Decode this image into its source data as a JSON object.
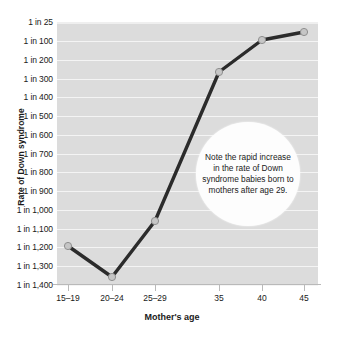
{
  "chart_data": {
    "type": "line",
    "title": "",
    "xlabel": "Mother's age",
    "ylabel": "Rate of Down syndrome",
    "categories": [
      "15–19",
      "20–24",
      "25–29",
      "35",
      "40",
      "45"
    ],
    "x_positions": [
      68,
      112,
      155,
      219,
      262,
      304
    ],
    "values": [
      1250,
      1400,
      1100,
      300,
      90,
      60
    ],
    "value_labels": [
      "1 in 1,250",
      "1 in 1,400",
      "1 in 1,100",
      "1 in 300",
      "1 in 90",
      "1 in 60"
    ],
    "y_tick_labels": [
      "1 in 25",
      "1 in 100",
      "1 in 200",
      "1 in 300",
      "1 in 400",
      "1 in 500",
      "1 in 600",
      "1 in 700",
      "1 in 800",
      "1 in 900",
      "1 in 1,000",
      "1 in 1,100",
      "1 in 1,200",
      "1 in 1,300",
      "1 in 1,400"
    ],
    "y_tick_values": [
      25,
      100,
      200,
      300,
      400,
      500,
      600,
      700,
      800,
      900,
      1000,
      1100,
      1200,
      1300,
      1400
    ],
    "y_tick_pixels": [
      22,
      41,
      60,
      79,
      97,
      116,
      135,
      154,
      172,
      191,
      210,
      229,
      247,
      266,
      285
    ],
    "grid": true,
    "legend": "none",
    "annotation": "Note the rapid increase in the rate of Down syndrome babies born to mothers after age 29.",
    "point_pixels": [
      {
        "x": 68,
        "y": 246
      },
      {
        "x": 112,
        "y": 277
      },
      {
        "x": 155,
        "y": 221
      },
      {
        "x": 219,
        "y": 72
      },
      {
        "x": 262,
        "y": 40
      },
      {
        "x": 304,
        "y": 32
      }
    ],
    "colors": {
      "plot_background": "#dcdcdc",
      "gridline": "#f4f4f4",
      "line": "#2b2b2b",
      "marker_fill": "#c6c6c6",
      "marker_stroke": "#8f8f8f",
      "axis": "#b9b9b9",
      "text": "#1a1a1a",
      "annotation_background": "#fdfdfd"
    }
  }
}
